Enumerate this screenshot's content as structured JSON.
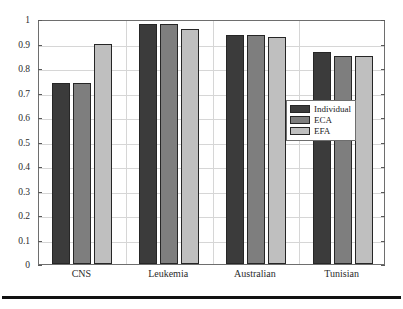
{
  "chart_data": {
    "type": "bar",
    "title": "",
    "xlabel": "",
    "ylabel": "",
    "ylim": [
      0,
      1
    ],
    "ytick_step": 0.1,
    "grid": true,
    "legend_position": "inside-right",
    "categories": [
      "CNS",
      "Leukemia",
      "Australian",
      "Tunisian"
    ],
    "yticks": [
      "0",
      "0.1",
      "0.2",
      "0.3",
      "0.4",
      "0.5",
      "0.6",
      "0.7",
      "0.8",
      "0.9",
      "1"
    ],
    "series": [
      {
        "name": "Individual",
        "color": "#3b3b3b",
        "values": [
          0.737,
          0.98,
          0.934,
          0.867
        ]
      },
      {
        "name": "ECA",
        "color": "#7e7e7e",
        "values": [
          0.737,
          0.98,
          0.934,
          0.85
        ]
      },
      {
        "name": "EFA",
        "color": "#bfbfbf",
        "values": [
          0.9,
          0.96,
          0.925,
          0.85
        ]
      }
    ]
  },
  "legend": {
    "entries": [
      {
        "label": "Individual"
      },
      {
        "label": "ECA"
      },
      {
        "label": "EFA"
      }
    ]
  },
  "axes": {
    "y_max_label": "1",
    "y_min_label": "0"
  }
}
